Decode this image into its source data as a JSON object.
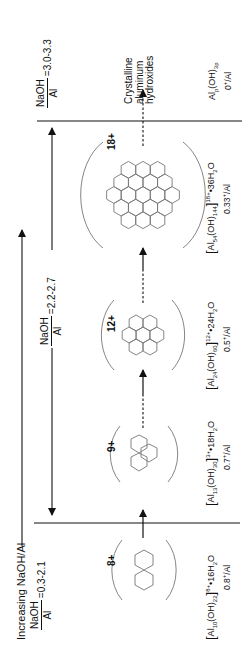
{
  "title_arrow": {
    "label": "Increasing NaOH/Al"
  },
  "ratios": [
    {
      "id": "low",
      "numerator": "NaOH",
      "denominator": "Al",
      "value": "=0.3-2.1"
    },
    {
      "id": "mid",
      "numerator": "NaOH",
      "denominator": "Al",
      "value": "=2.2-2.7"
    },
    {
      "id": "high",
      "numerator": "NaOH",
      "denominator": "Al",
      "value": "=3.0-3.3"
    }
  ],
  "species": [
    {
      "charge": "8+",
      "formula": {
        "al_sub": "10",
        "oh_sub": "22",
        "sup": "8+",
        "water": "•16H",
        "water_sub": "2",
        "water_tail": "O"
      },
      "charge_per_al": {
        "value": "0.8",
        "sup": "+",
        "tail": "/Al"
      },
      "hexagons": 2
    },
    {
      "charge": "9+",
      "formula": {
        "al_sub": "13",
        "oh_sub": "30",
        "sup": "3+",
        "water": "•18H",
        "water_sub": "2",
        "water_tail": "O"
      },
      "charge_per_al": {
        "value": "0.7",
        "sup": "+",
        "tail": "/Al"
      },
      "hexagons": 3
    },
    {
      "charge": "12+",
      "formula": {
        "al_sub": "24",
        "oh_sub": "60",
        "sup": "12+",
        "water": "•24H",
        "water_sub": "2",
        "water_tail": "O"
      },
      "charge_per_al": {
        "value": "0.5",
        "sup": "+",
        "tail": "/Al"
      },
      "hexagons": 7
    },
    {
      "charge": "18+",
      "formula": {
        "al_sub": "54",
        "oh_sub": "144",
        "sup": "18+",
        "water": "•36H",
        "water_sub": "2",
        "water_tail": "O"
      },
      "charge_per_al": {
        "value": "0.33",
        "sup": "+",
        "tail": "/Al"
      },
      "hexagons": 19
    }
  ],
  "product": {
    "lines": [
      "Crystalline",
      "aluminum",
      "hydroxides"
    ],
    "formula": {
      "al_sub": "p",
      "oh_sub": "3p"
    },
    "charge_per_al": {
      "value": "0",
      "sup": "+",
      "tail": "/Al"
    }
  },
  "colors": {
    "line": "#111111",
    "hexagon": "#777777",
    "arc": "#777777"
  }
}
